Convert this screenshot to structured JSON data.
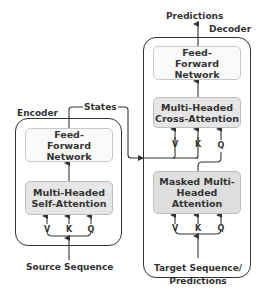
{
  "encoder": {
    "title": "Encoder",
    "ffn_label": "Feed-Forward Network",
    "attention_label": "Multi-Headed Self-Attention",
    "inputs": [
      "V",
      "K",
      "Q"
    ],
    "input_label": "Source Sequence"
  },
  "states_label": "States",
  "decoder": {
    "title": "Decoder",
    "output_label": "Predictions",
    "ffn_label": "Feed-Forward Network",
    "cross_attention_label": "Multi-Headed Cross-Attention",
    "cross_inputs": [
      "V",
      "K",
      "Q"
    ],
    "masked_attention_label": "Masked Multi-Headed Attention",
    "masked_inputs": [
      "V",
      "K",
      "Q"
    ],
    "input_label": "Target Sequence/ Predictions"
  },
  "colors": {
    "line": "#333333",
    "box_border": "#c8c8c8",
    "attention_fill": "#e6e6e6",
    "ffn_fill": "#fafafa"
  }
}
